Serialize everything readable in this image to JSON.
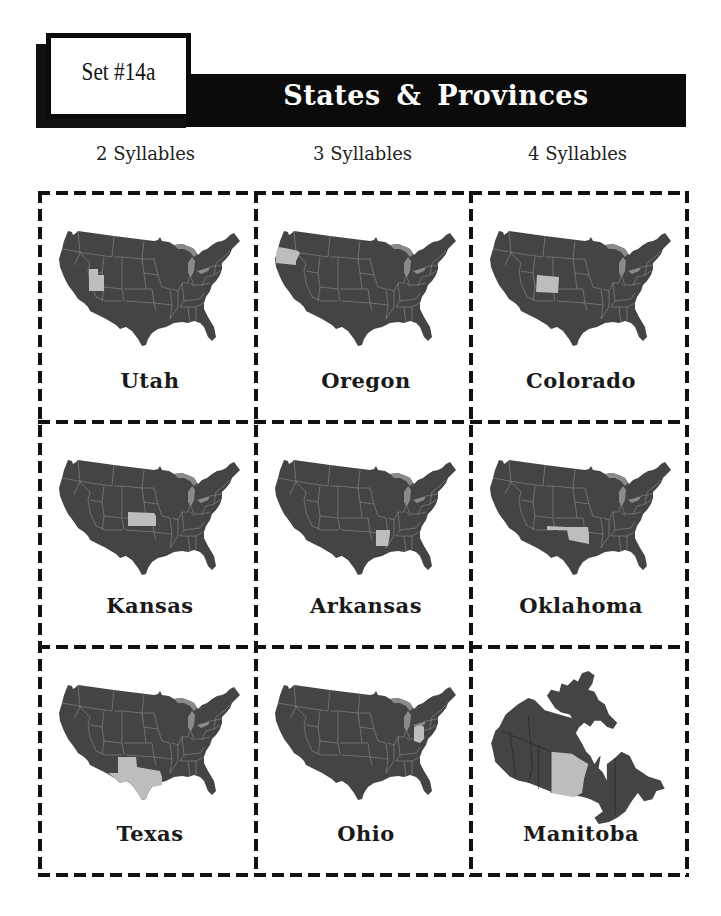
{
  "header": {
    "set_label": "Set #14a",
    "title": "States & Provinces"
  },
  "columns": [
    {
      "label": "2 Syllables"
    },
    {
      "label": "3 Syllables"
    },
    {
      "label": "4 Syllables"
    }
  ],
  "colors": {
    "map_fill": "#444444",
    "map_border": "#9a9a9a",
    "highlight": "#bdbdbd",
    "lakes": "#8a8a8a",
    "banner": "#0b0b0b",
    "dashes": "#111111"
  },
  "cards": [
    {
      "name": "Utah",
      "map": "usa",
      "highlight": "utah",
      "row": 0,
      "col": 0
    },
    {
      "name": "Oregon",
      "map": "usa",
      "highlight": "oregon",
      "row": 0,
      "col": 1
    },
    {
      "name": "Colorado",
      "map": "usa",
      "highlight": "colorado",
      "row": 0,
      "col": 2
    },
    {
      "name": "Kansas",
      "map": "usa",
      "highlight": "kansas",
      "row": 1,
      "col": 0
    },
    {
      "name": "Arkansas",
      "map": "usa",
      "highlight": "arkansas",
      "row": 1,
      "col": 1
    },
    {
      "name": "Oklahoma",
      "map": "usa",
      "highlight": "oklahoma",
      "row": 1,
      "col": 2
    },
    {
      "name": "Texas",
      "map": "usa",
      "highlight": "texas",
      "row": 2,
      "col": 0
    },
    {
      "name": "Ohio",
      "map": "usa",
      "highlight": "ohio",
      "row": 2,
      "col": 1
    },
    {
      "name": "Manitoba",
      "map": "canada",
      "highlight": "manitoba",
      "row": 2,
      "col": 2
    }
  ]
}
